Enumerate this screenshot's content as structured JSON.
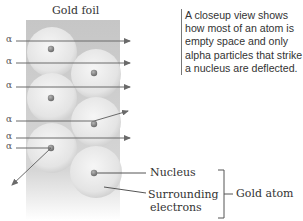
{
  "diagram": {
    "foil_label": "Gold foil",
    "caption": "A closeup view shows how most of an atom is empty space and only alpha particles that strike a nucleus are deflected.",
    "particle_symbol": "α",
    "alpha_rows": [
      {
        "y": 41,
        "path": "straight"
      },
      {
        "y": 63,
        "path": "straight"
      },
      {
        "y": 87,
        "path": "straight"
      },
      {
        "y": 121,
        "path": "deflected-up"
      },
      {
        "y": 138,
        "path": "straight"
      },
      {
        "y": 148,
        "path": "deflected-back"
      }
    ],
    "labels": {
      "nucleus": "Nucleus",
      "surrounding_line1": "Surrounding",
      "surrounding_line2": "electrons",
      "gold_atom": "Gold atom"
    },
    "colors": {
      "foil_top": "#c9c9c9",
      "foil_bottom": "#ffffff",
      "sphere": "#ececec",
      "nucleus": "#8a8a8a",
      "arrow": "#6a6a6a",
      "text": "#333333"
    }
  }
}
